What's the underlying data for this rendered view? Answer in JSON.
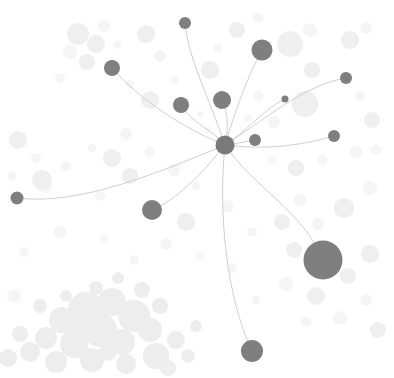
{
  "view": {
    "title": "Network Graph",
    "width": 394,
    "height": 378,
    "background_color": "#ffffff"
  },
  "style": {
    "node_color": "#7f7f7f",
    "node_color_hub": "#7a7a7a",
    "edge_color": "#c9c9c9",
    "edge_width": 0.9,
    "halo_color": "#efefef",
    "halo_color_faint": "#f5f5f5",
    "cluster_color": "#ededed"
  },
  "chart_data": {
    "type": "scatter",
    "xlabel": "",
    "ylabel": "",
    "xlim": [
      0,
      394
    ],
    "ylim": [
      0,
      378
    ],
    "grid": false,
    "legend": "none",
    "nodes": [
      {
        "id": "hub",
        "x": 225,
        "y": 145,
        "r": 9.5,
        "color": "#7a7a7a"
      },
      {
        "id": "n1",
        "x": 185,
        "y": 23,
        "r": 6.0,
        "color": "#7f7f7f"
      },
      {
        "id": "n2",
        "x": 262,
        "y": 50,
        "r": 10.5,
        "color": "#7f7f7f"
      },
      {
        "id": "n3",
        "x": 112,
        "y": 68,
        "r": 8.0,
        "color": "#7f7f7f"
      },
      {
        "id": "n4",
        "x": 346,
        "y": 78,
        "r": 6.0,
        "color": "#7f7f7f"
      },
      {
        "id": "n5",
        "x": 285,
        "y": 99,
        "r": 3.5,
        "color": "#7f7f7f"
      },
      {
        "id": "n6",
        "x": 181,
        "y": 105,
        "r": 8.0,
        "color": "#7f7f7f"
      },
      {
        "id": "n7",
        "x": 222,
        "y": 100,
        "r": 9.0,
        "color": "#7f7f7f"
      },
      {
        "id": "n8",
        "x": 334,
        "y": 136,
        "r": 6.0,
        "color": "#7f7f7f"
      },
      {
        "id": "n9",
        "x": 255,
        "y": 140,
        "r": 6.0,
        "color": "#7f7f7f"
      },
      {
        "id": "n10",
        "x": 17,
        "y": 198,
        "r": 6.5,
        "color": "#7f7f7f"
      },
      {
        "id": "n11",
        "x": 152,
        "y": 210,
        "r": 10.0,
        "color": "#7f7f7f"
      },
      {
        "id": "n12",
        "x": 323,
        "y": 260,
        "r": 19.5,
        "color": "#7f7f7f"
      },
      {
        "id": "n13",
        "x": 252,
        "y": 351,
        "r": 11.0,
        "color": "#7f7f7f"
      }
    ],
    "edges": [
      {
        "source": "hub",
        "target": "n1",
        "c1x": 208,
        "c1y": 95,
        "c2x": 188,
        "c2y": 58
      },
      {
        "source": "hub",
        "target": "n2",
        "c1x": 236,
        "c1y": 108,
        "c2x": 248,
        "c2y": 76
      },
      {
        "source": "hub",
        "target": "n3",
        "c1x": 182,
        "c1y": 128,
        "c2x": 138,
        "c2y": 98
      },
      {
        "source": "hub",
        "target": "n4",
        "c1x": 264,
        "c1y": 120,
        "c2x": 306,
        "c2y": 84
      },
      {
        "source": "hub",
        "target": "n5",
        "c1x": 250,
        "c1y": 128,
        "c2x": 268,
        "c2y": 106
      },
      {
        "source": "hub",
        "target": "n6",
        "c1x": 213,
        "c1y": 130,
        "c2x": 190,
        "c2y": 122
      },
      {
        "source": "hub",
        "target": "n7",
        "c1x": 229,
        "c1y": 128,
        "c2x": 228,
        "c2y": 115
      },
      {
        "source": "hub",
        "target": "n8",
        "c1x": 264,
        "c1y": 150,
        "c2x": 300,
        "c2y": 146
      },
      {
        "source": "hub",
        "target": "n9",
        "c1x": 238,
        "c1y": 144,
        "c2x": 246,
        "c2y": 141
      },
      {
        "source": "hub",
        "target": "n10",
        "c1x": 160,
        "c1y": 172,
        "c2x": 80,
        "c2y": 206
      },
      {
        "source": "hub",
        "target": "n11",
        "c1x": 200,
        "c1y": 176,
        "c2x": 176,
        "c2y": 200
      },
      {
        "source": "hub",
        "target": "n12",
        "c1x": 252,
        "c1y": 186,
        "c2x": 304,
        "c2y": 212
      },
      {
        "source": "hub",
        "target": "n13",
        "c1x": 218,
        "c1y": 212,
        "c2x": 226,
        "c2y": 296
      }
    ],
    "halos": [
      {
        "x": 78,
        "y": 34,
        "r": 11
      },
      {
        "x": 96,
        "y": 44,
        "r": 9
      },
      {
        "x": 70,
        "y": 52,
        "r": 7
      },
      {
        "x": 87,
        "y": 62,
        "r": 8
      },
      {
        "x": 104,
        "y": 26,
        "r": 6
      },
      {
        "x": 118,
        "y": 45,
        "r": 4
      },
      {
        "x": 60,
        "y": 78,
        "r": 5
      },
      {
        "x": 146,
        "y": 34,
        "r": 9
      },
      {
        "x": 160,
        "y": 56,
        "r": 6
      },
      {
        "x": 130,
        "y": 84,
        "r": 4
      },
      {
        "x": 150,
        "y": 100,
        "r": 9
      },
      {
        "x": 175,
        "y": 80,
        "r": 4
      },
      {
        "x": 210,
        "y": 70,
        "r": 9
      },
      {
        "x": 237,
        "y": 30,
        "r": 8
      },
      {
        "x": 258,
        "y": 18,
        "r": 5
      },
      {
        "x": 218,
        "y": 48,
        "r": 4
      },
      {
        "x": 290,
        "y": 44,
        "r": 13
      },
      {
        "x": 310,
        "y": 30,
        "r": 7
      },
      {
        "x": 350,
        "y": 40,
        "r": 9
      },
      {
        "x": 366,
        "y": 28,
        "r": 6
      },
      {
        "x": 312,
        "y": 70,
        "r": 8
      },
      {
        "x": 305,
        "y": 104,
        "r": 13
      },
      {
        "x": 274,
        "y": 122,
        "r": 6
      },
      {
        "x": 258,
        "y": 96,
        "r": 5
      },
      {
        "x": 248,
        "y": 118,
        "r": 4
      },
      {
        "x": 360,
        "y": 96,
        "r": 5
      },
      {
        "x": 372,
        "y": 120,
        "r": 8
      },
      {
        "x": 356,
        "y": 152,
        "r": 6
      },
      {
        "x": 322,
        "y": 160,
        "r": 5
      },
      {
        "x": 296,
        "y": 168,
        "r": 8
      },
      {
        "x": 272,
        "y": 160,
        "r": 4
      },
      {
        "x": 18,
        "y": 140,
        "r": 9
      },
      {
        "x": 36,
        "y": 158,
        "r": 5
      },
      {
        "x": 12,
        "y": 176,
        "r": 4
      },
      {
        "x": 45,
        "y": 186,
        "r": 7
      },
      {
        "x": 66,
        "y": 166,
        "r": 5
      },
      {
        "x": 92,
        "y": 148,
        "r": 4
      },
      {
        "x": 112,
        "y": 158,
        "r": 9
      },
      {
        "x": 130,
        "y": 176,
        "r": 8
      },
      {
        "x": 150,
        "y": 152,
        "r": 5
      },
      {
        "x": 174,
        "y": 170,
        "r": 6
      },
      {
        "x": 42,
        "y": 180,
        "r": 10
      },
      {
        "x": 100,
        "y": 196,
        "r": 5
      },
      {
        "x": 126,
        "y": 134,
        "r": 6
      },
      {
        "x": 196,
        "y": 186,
        "r": 4
      },
      {
        "x": 228,
        "y": 206,
        "r": 6
      },
      {
        "x": 186,
        "y": 222,
        "r": 9
      },
      {
        "x": 252,
        "y": 232,
        "r": 5
      },
      {
        "x": 282,
        "y": 222,
        "r": 8
      },
      {
        "x": 300,
        "y": 200,
        "r": 6
      },
      {
        "x": 344,
        "y": 208,
        "r": 10
      },
      {
        "x": 370,
        "y": 188,
        "r": 7
      },
      {
        "x": 318,
        "y": 224,
        "r": 6
      },
      {
        "x": 294,
        "y": 250,
        "r": 8
      },
      {
        "x": 286,
        "y": 284,
        "r": 7
      },
      {
        "x": 316,
        "y": 296,
        "r": 9
      },
      {
        "x": 348,
        "y": 276,
        "r": 8
      },
      {
        "x": 370,
        "y": 254,
        "r": 9
      },
      {
        "x": 366,
        "y": 300,
        "r": 6
      },
      {
        "x": 340,
        "y": 318,
        "r": 7
      },
      {
        "x": 306,
        "y": 322,
        "r": 5
      },
      {
        "x": 378,
        "y": 330,
        "r": 8
      },
      {
        "x": 256,
        "y": 300,
        "r": 4
      },
      {
        "x": 232,
        "y": 268,
        "r": 5
      },
      {
        "x": 200,
        "y": 256,
        "r": 4
      },
      {
        "x": 166,
        "y": 244,
        "r": 6
      },
      {
        "x": 134,
        "y": 260,
        "r": 5
      },
      {
        "x": 104,
        "y": 238,
        "r": 4
      },
      {
        "x": 60,
        "y": 232,
        "r": 6
      },
      {
        "x": 24,
        "y": 252,
        "r": 5
      },
      {
        "x": 14,
        "y": 296,
        "r": 7
      },
      {
        "x": 376,
        "y": 150,
        "r": 5
      },
      {
        "x": 208,
        "y": 130,
        "r": 3
      },
      {
        "x": 200,
        "y": 114,
        "r": 3
      }
    ],
    "cluster_blobs": [
      {
        "x": 86,
        "y": 310,
        "r": 18
      },
      {
        "x": 112,
        "y": 302,
        "r": 14
      },
      {
        "x": 62,
        "y": 320,
        "r": 13
      },
      {
        "x": 134,
        "y": 316,
        "r": 16
      },
      {
        "x": 100,
        "y": 330,
        "r": 17
      },
      {
        "x": 46,
        "y": 338,
        "r": 11
      },
      {
        "x": 74,
        "y": 344,
        "r": 14
      },
      {
        "x": 122,
        "y": 342,
        "r": 13
      },
      {
        "x": 150,
        "y": 330,
        "r": 12
      },
      {
        "x": 30,
        "y": 352,
        "r": 10
      },
      {
        "x": 56,
        "y": 362,
        "r": 11
      },
      {
        "x": 92,
        "y": 360,
        "r": 12
      },
      {
        "x": 126,
        "y": 364,
        "r": 10
      },
      {
        "x": 156,
        "y": 356,
        "r": 13
      },
      {
        "x": 176,
        "y": 340,
        "r": 9
      },
      {
        "x": 20,
        "y": 334,
        "r": 8
      },
      {
        "x": 8,
        "y": 358,
        "r": 9
      },
      {
        "x": 168,
        "y": 368,
        "r": 8
      },
      {
        "x": 142,
        "y": 290,
        "r": 8
      },
      {
        "x": 96,
        "y": 288,
        "r": 7
      },
      {
        "x": 66,
        "y": 296,
        "r": 6
      },
      {
        "x": 118,
        "y": 278,
        "r": 6
      },
      {
        "x": 188,
        "y": 356,
        "r": 7
      },
      {
        "x": 40,
        "y": 306,
        "r": 7
      },
      {
        "x": 160,
        "y": 306,
        "r": 8
      },
      {
        "x": 196,
        "y": 326,
        "r": 6
      },
      {
        "x": 108,
        "y": 352,
        "r": 9
      },
      {
        "x": 80,
        "y": 330,
        "r": 10
      }
    ]
  }
}
